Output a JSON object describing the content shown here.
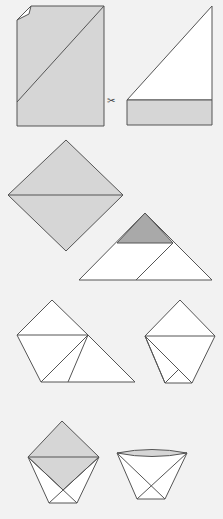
{
  "diagram": {
    "colors": {
      "background": "#f2f2f2",
      "paper_gray": "#d6d6d6",
      "paper_dark": "#a9a9a9",
      "paper_white": "#ffffff",
      "stroke": "#555555"
    },
    "icons": {
      "scissors": "✂"
    },
    "steps": [
      {
        "id": 1,
        "description": "Rectangle sheet with diagonal fold"
      },
      {
        "id": 2,
        "description": "Cut off the bottom strip"
      },
      {
        "id": 3,
        "description": "Square folded into triangle"
      },
      {
        "id": 4,
        "description": "Triangle with top flap and diagonal"
      },
      {
        "id": 5,
        "description": "Fold left corner across"
      },
      {
        "id": 6,
        "description": "Fold right corner across"
      },
      {
        "id": 7,
        "description": "Fold top flaps down"
      },
      {
        "id": 8,
        "description": "Open the cup"
      }
    ]
  }
}
